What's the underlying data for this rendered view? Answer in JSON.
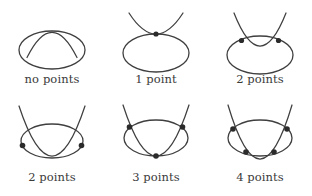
{
  "figure": {
    "stroke_color": "#403f40",
    "point_color": "#2b2b2b",
    "background_color": "#ffffff",
    "columns": 3,
    "rows": 2
  },
  "panels": [
    {
      "id": "panel-no-points",
      "caption": "no points",
      "intersection_count": 0,
      "description": "parabola vertex sits above the ellipse, no contact",
      "ellipse": {
        "cx": 52,
        "cy": 50,
        "rx": 33,
        "ry": 19
      },
      "parabola": {
        "a": 0.052,
        "vx": 52,
        "vy": 25,
        "x_from": 27,
        "x_to": 77
      },
      "points": []
    },
    {
      "id": "panel-1-point",
      "caption": "1 point",
      "intersection_count": 1,
      "description": "parabola tangent to the top of the ellipse",
      "ellipse": {
        "cx": 52,
        "cy": 53,
        "rx": 33,
        "ry": 19
      },
      "parabola": {
        "a": 0.052,
        "vx": 52,
        "vy": 34,
        "x_from": 25,
        "x_to": 79
      },
      "points": [
        {
          "x": 52,
          "y": 34
        }
      ]
    },
    {
      "id": "panel-2-points-top",
      "caption": "2 points",
      "intersection_count": 2,
      "description": "parabola vertex dips inside the ellipse, crossing the upper arc twice",
      "ellipse": {
        "cx": 52,
        "cy": 55,
        "rx": 33,
        "ry": 19
      },
      "parabola": {
        "a": 0.055,
        "vx": 52,
        "vy": 46,
        "x_from": 26,
        "x_to": 78
      },
      "points": [
        {
          "x": 35,
          "y": 41
        },
        {
          "x": 69,
          "y": 41
        }
      ]
    },
    {
      "id": "panel-2-points-side",
      "caption": "2 points",
      "intersection_count": 2,
      "description": "wide parabola crosses the sides of the ellipse, vertex below the ellipse",
      "ellipse": {
        "cx": 52,
        "cy": 141,
        "rx": 31,
        "ry": 17
      },
      "parabola": {
        "a": 0.036,
        "vx": 52,
        "vy": 170,
        "x_from": 19,
        "x_to": 85
      },
      "points": [
        {
          "x": 23,
          "y": 145
        },
        {
          "x": 81,
          "y": 145
        }
      ]
    },
    {
      "id": "panel-3-points",
      "caption": "3 points",
      "intersection_count": 3,
      "description": "two upper crossings plus a tangency at the bottom of the ellipse",
      "ellipse": {
        "cx": 52,
        "cy": 138,
        "rx": 32,
        "ry": 18
      },
      "parabola": {
        "a": 0.047,
        "vx": 52,
        "vy": 156,
        "x_from": 19,
        "x_to": 85
      },
      "points": [
        {
          "x": 26,
          "y": 127
        },
        {
          "x": 78,
          "y": 127
        },
        {
          "x": 52,
          "y": 156
        }
      ]
    },
    {
      "id": "panel-4-points",
      "caption": "4 points",
      "intersection_count": 4,
      "description": "parabola crosses the ellipse twice above and twice below",
      "ellipse": {
        "cx": 52,
        "cy": 138,
        "rx": 32,
        "ry": 18
      },
      "parabola": {
        "a": 0.047,
        "vx": 52,
        "vy": 162,
        "x_from": 20,
        "x_to": 84
      },
      "points": [
        {
          "x": 25,
          "y": 129
        },
        {
          "x": 79,
          "y": 129
        },
        {
          "x": 38,
          "y": 152
        },
        {
          "x": 66,
          "y": 152
        }
      ]
    }
  ]
}
